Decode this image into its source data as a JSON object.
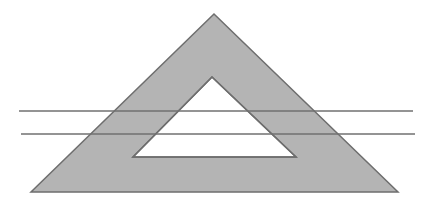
{
  "diagram": {
    "colors": {
      "background": "#ffffff",
      "frame_fill": "#b4b4b4",
      "frame_stroke": "#6e6e6e",
      "hole_fill": "#ffffff",
      "line_stroke": "#707070"
    },
    "outer_triangle": {
      "apex": [
        214,
        14
      ],
      "bottom_left": [
        31,
        192
      ],
      "bottom_right": [
        398,
        192
      ]
    },
    "inner_triangle": {
      "apex": [
        212,
        77
      ],
      "bottom_left": [
        133,
        157
      ],
      "bottom_right": [
        296,
        157
      ]
    },
    "lines": [
      {
        "x1": 19,
        "y1": 111,
        "x2": 413,
        "y2": 111
      },
      {
        "x1": 21,
        "y1": 134,
        "x2": 415,
        "y2": 134
      }
    ]
  }
}
